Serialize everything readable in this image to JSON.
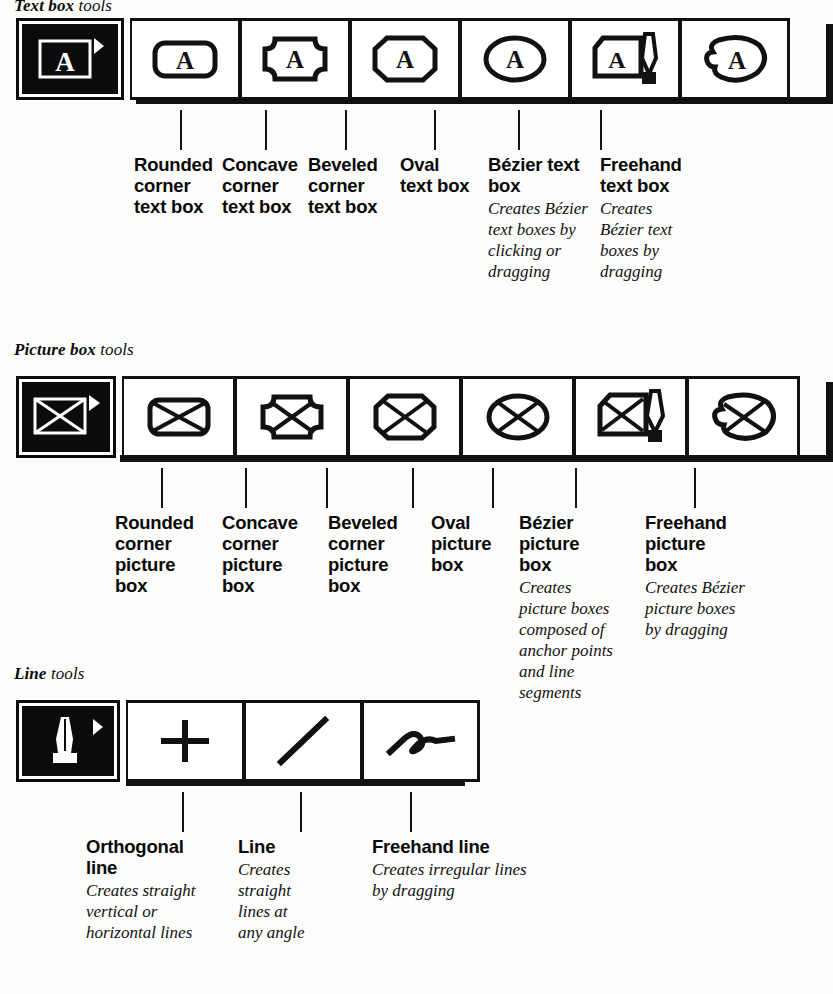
{
  "sections": [
    {
      "id": "text-box",
      "heading_strong": "Text box",
      "heading_light": "tools",
      "selected_tool": "text-box-tool",
      "tools": [
        {
          "icon": "rounded-corner-text-box-icon",
          "title": "Rounded\ncorner\ntext box",
          "desc": ""
        },
        {
          "icon": "concave-corner-text-box-icon",
          "title": "Concave\ncorner\ntext box",
          "desc": ""
        },
        {
          "icon": "beveled-corner-text-box-icon",
          "title": "Beveled\ncorner\ntext box",
          "desc": ""
        },
        {
          "icon": "oval-text-box-icon",
          "title": "Oval\ntext box",
          "desc": ""
        },
        {
          "icon": "bezier-text-box-icon",
          "title": "Bézier text\nbox",
          "desc": "Creates Bézier text boxes by clicking or dragging"
        },
        {
          "icon": "freehand-text-box-icon",
          "title": "Freehand\ntext box",
          "desc": "Creates Bézier text boxes by dragging"
        }
      ]
    },
    {
      "id": "picture-box",
      "heading_strong": "Picture box",
      "heading_light": "tools",
      "selected_tool": "picture-box-tool",
      "tools": [
        {
          "icon": "rounded-corner-picture-box-icon",
          "title": "Rounded\ncorner\npicture\nbox",
          "desc": ""
        },
        {
          "icon": "concave-corner-picture-box-icon",
          "title": "Concave\ncorner\npicture\nbox",
          "desc": ""
        },
        {
          "icon": "beveled-corner-picture-box-icon",
          "title": "Beveled\ncorner\npicture\nbox",
          "desc": ""
        },
        {
          "icon": "oval-picture-box-icon",
          "title": "Oval\npicture\nbox",
          "desc": ""
        },
        {
          "icon": "bezier-picture-box-icon",
          "title": "Bézier\npicture\nbox",
          "desc": "Creates picture boxes composed of anchor points and line segments"
        },
        {
          "icon": "freehand-picture-box-icon",
          "title": "Freehand\npicture\nbox",
          "desc": "Creates Bézier picture boxes by dragging"
        }
      ]
    },
    {
      "id": "line",
      "heading_strong": "Line",
      "heading_light": "tools",
      "selected_tool": "bezier-line-tool",
      "tools": [
        {
          "icon": "orthogonal-line-icon",
          "title": "Orthogonal\nline",
          "desc": "Creates straight vertical or horizontal lines"
        },
        {
          "icon": "line-icon",
          "title": "Line",
          "desc": "Creates straight lines at any angle"
        },
        {
          "icon": "freehand-line-icon",
          "title": "Freehand line",
          "desc": "Creates irregular lines by dragging"
        }
      ]
    }
  ],
  "colors": {
    "ink": "#0b0b0b",
    "paper": "#fdfdfb"
  }
}
